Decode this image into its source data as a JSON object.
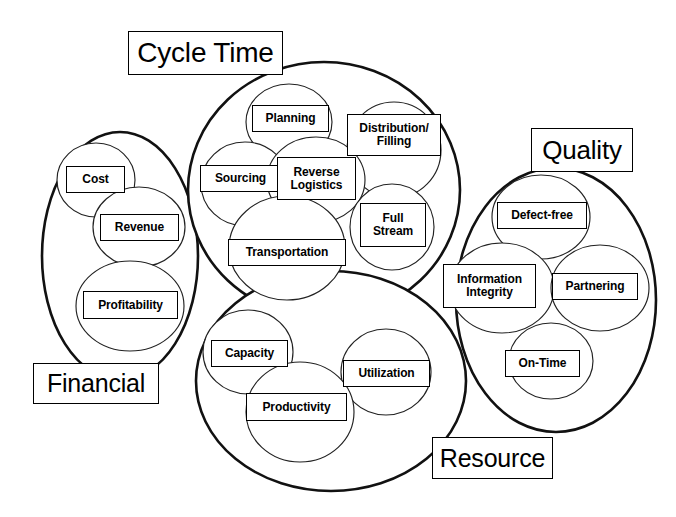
{
  "diagram": {
    "stroke_color": "#111111",
    "metric_stroke_color": "#222222",
    "background_color": "#ffffff",
    "clusters": [
      {
        "id": "financial",
        "label": "Financial",
        "label_box": {
          "x": 33,
          "y": 363,
          "w": 126,
          "h": 41,
          "font_size": 25
        },
        "shape": {
          "type": "ellipse",
          "cx": 120,
          "cy": 256,
          "rx": 78,
          "ry": 124
        },
        "metrics": [
          {
            "label": "Cost",
            "shape": {
              "type": "ellipse",
              "cx": 96,
              "cy": 180,
              "rx": 39,
              "ry": 37
            },
            "box": {
              "x": 66,
              "y": 166,
              "w": 59,
              "h": 27,
              "font_size": 12
            }
          },
          {
            "label": "Revenue",
            "shape": {
              "type": "ellipse",
              "cx": 139,
              "cy": 227,
              "rx": 46,
              "ry": 40
            },
            "box": {
              "x": 100,
              "y": 214,
              "w": 79,
              "h": 27,
              "font_size": 12
            }
          },
          {
            "label": "Profitability",
            "shape": {
              "type": "ellipse",
              "cx": 130,
              "cy": 306,
              "rx": 54,
              "ry": 45
            },
            "box": {
              "x": 83,
              "y": 291,
              "w": 95,
              "h": 28,
              "font_size": 12
            }
          }
        ]
      },
      {
        "id": "cycle-time",
        "label": "Cycle Time",
        "label_box": {
          "x": 128,
          "y": 31,
          "w": 155,
          "h": 44,
          "font_size": 28
        },
        "shape": {
          "type": "ellipse",
          "cx": 324,
          "cy": 190,
          "rx": 136,
          "ry": 128
        },
        "metrics": [
          {
            "label": "Planning",
            "shape": {
              "type": "ellipse",
              "cx": 289,
              "cy": 122,
              "rx": 43,
              "ry": 38
            },
            "box": {
              "x": 252,
              "y": 105,
              "w": 77,
              "h": 27,
              "font_size": 12
            }
          },
          {
            "label": "Distribution/\nFilling",
            "shape": {
              "type": "ellipse",
              "cx": 394,
              "cy": 150,
              "rx": 47,
              "ry": 48
            },
            "box": {
              "x": 347,
              "y": 114,
              "w": 94,
              "h": 42,
              "font_size": 12
            }
          },
          {
            "label": "Sourcing",
            "shape": {
              "type": "ellipse",
              "cx": 245,
              "cy": 184,
              "rx": 44,
              "ry": 42
            },
            "box": {
              "x": 200,
              "y": 165,
              "w": 81,
              "h": 27,
              "font_size": 12
            }
          },
          {
            "label": "Reverse\nLogistics",
            "shape": {
              "type": "ellipse",
              "cx": 316,
              "cy": 180,
              "rx": 49,
              "ry": 43
            },
            "box": {
              "x": 277,
              "y": 157,
              "w": 79,
              "h": 43,
              "font_size": 12
            }
          },
          {
            "label": "Full\nStream",
            "shape": {
              "type": "ellipse",
              "cx": 392,
              "cy": 227,
              "rx": 42,
              "ry": 43
            },
            "box": {
              "x": 360,
              "y": 203,
              "w": 66,
              "h": 44,
              "font_size": 12
            }
          },
          {
            "label": "Transportation",
            "shape": {
              "type": "ellipse",
              "cx": 287,
              "cy": 248,
              "rx": 58,
              "ry": 52
            },
            "box": {
              "x": 228,
              "y": 239,
              "w": 118,
              "h": 27,
              "font_size": 12
            }
          }
        ]
      },
      {
        "id": "quality",
        "label": "Quality",
        "label_box": {
          "x": 531,
          "y": 128,
          "w": 102,
          "h": 44,
          "font_size": 26
        },
        "shape": {
          "type": "ellipse",
          "cx": 556,
          "cy": 300,
          "rx": 100,
          "ry": 132
        },
        "metrics": [
          {
            "label": "Defect-free",
            "shape": {
              "type": "ellipse",
              "cx": 541,
              "cy": 217,
              "rx": 49,
              "ry": 42
            },
            "box": {
              "x": 497,
              "y": 202,
              "w": 90,
              "h": 27,
              "font_size": 12
            }
          },
          {
            "label": "Information\nIntegrity",
            "shape": {
              "type": "ellipse",
              "cx": 502,
              "cy": 288,
              "rx": 52,
              "ry": 45
            },
            "box": {
              "x": 443,
              "y": 264,
              "w": 93,
              "h": 44,
              "font_size": 12
            }
          },
          {
            "label": "Partnering",
            "shape": {
              "type": "ellipse",
              "cx": 600,
              "cy": 288,
              "rx": 49,
              "ry": 43
            },
            "box": {
              "x": 552,
              "y": 273,
              "w": 86,
              "h": 27,
              "font_size": 12
            }
          },
          {
            "label": "On-Time",
            "shape": {
              "type": "ellipse",
              "cx": 551,
              "cy": 361,
              "rx": 42,
              "ry": 38
            },
            "box": {
              "x": 505,
              "y": 350,
              "w": 75,
              "h": 27,
              "font_size": 12
            }
          }
        ]
      },
      {
        "id": "resource",
        "label": "Resource",
        "label_box": {
          "x": 432,
          "y": 437,
          "w": 121,
          "h": 42,
          "font_size": 25
        },
        "shape": {
          "type": "ellipse",
          "cx": 331,
          "cy": 381,
          "rx": 135,
          "ry": 110
        },
        "metrics": [
          {
            "label": "Capacity",
            "shape": {
              "type": "ellipse",
              "cx": 248,
              "cy": 352,
              "rx": 45,
              "ry": 42
            },
            "box": {
              "x": 211,
              "y": 340,
              "w": 77,
              "h": 27,
              "font_size": 12
            }
          },
          {
            "label": "Utilization",
            "shape": {
              "type": "ellipse",
              "cx": 386,
              "cy": 372,
              "rx": 45,
              "ry": 43
            },
            "box": {
              "x": 343,
              "y": 360,
              "w": 87,
              "h": 27,
              "font_size": 12
            }
          },
          {
            "label": "Productivity",
            "shape": {
              "type": "ellipse",
              "cx": 300,
              "cy": 412,
              "rx": 54,
              "ry": 50
            },
            "box": {
              "x": 246,
              "y": 393,
              "w": 101,
              "h": 28,
              "font_size": 12
            }
          }
        ]
      }
    ]
  }
}
